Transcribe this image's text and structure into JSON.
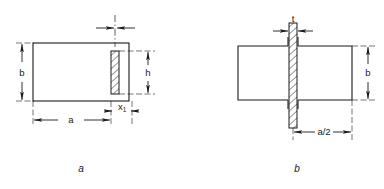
{
  "figure": {
    "type": "engineering-drawing",
    "background_color": "#ffffff",
    "line_color": "#1a1a1a",
    "hatch_color": "#1a1a1a",
    "subfigures": [
      {
        "id": "a",
        "caption": "a",
        "name": "plan-view-single-plate",
        "dimensions": [
          {
            "name": "b",
            "label": "b",
            "position": "left",
            "orientation": "vertical"
          },
          {
            "name": "h",
            "label": "h",
            "position": "right",
            "orientation": "vertical"
          },
          {
            "name": "a",
            "label": "a",
            "position": "bottom",
            "orientation": "horizontal"
          },
          {
            "name": "x1",
            "label": "x",
            "subscript": "1",
            "position": "bottom-right",
            "orientation": "horizontal"
          },
          {
            "name": "t",
            "label": "",
            "position": "top",
            "orientation": "horizontal"
          }
        ]
      },
      {
        "id": "b",
        "caption": "b",
        "name": "plan-view-through-plate",
        "dimensions": [
          {
            "name": "t",
            "label": "t",
            "position": "top",
            "orientation": "horizontal"
          },
          {
            "name": "b",
            "label": "b",
            "position": "right",
            "orientation": "vertical"
          },
          {
            "name": "a-half",
            "label": "a/2",
            "position": "bottom",
            "orientation": "horizontal"
          }
        ]
      }
    ]
  }
}
